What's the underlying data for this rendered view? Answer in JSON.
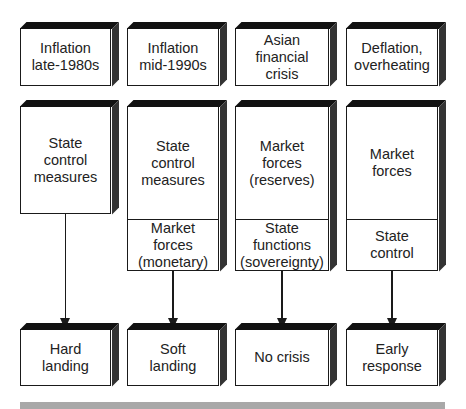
{
  "columns": [
    {
      "trigger": "Inflation\nlate-1980s",
      "response_upper": "State\ncontrol\nmeasures",
      "response_lower": null,
      "outcome": "Hard\nlanding"
    },
    {
      "trigger": "Inflation\nmid-1990s",
      "response_upper": "State\ncontrol\nmeasures",
      "response_lower": "Market forces\n(monetary)",
      "outcome": "Soft\nlanding"
    },
    {
      "trigger": "Asian\nfinancial\ncrisis",
      "response_upper": "Market\nforces\n(reserves)",
      "response_lower": "State\nfunctions\n(sovereignty)",
      "outcome": "No crisis"
    },
    {
      "trigger": "Deflation,\noverheating",
      "response_upper": "Market\nforces",
      "response_lower": "State\ncontrol",
      "outcome": "Early\nresponse"
    }
  ],
  "colors": {
    "box_border": "#1a1a1a",
    "box_fill": "#ffffff",
    "box_shadow_top": "#111111",
    "box_shadow_side": "#333333",
    "footer_bar": "#a8a8a8"
  }
}
